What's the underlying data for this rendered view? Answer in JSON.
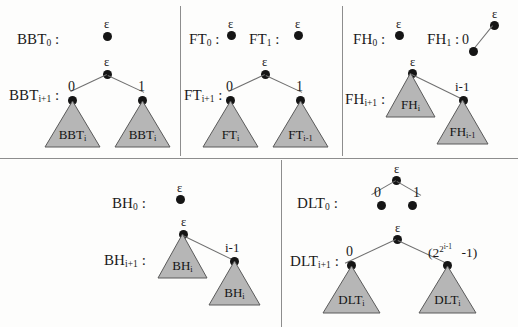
{
  "figure": {
    "epsilon": "ε",
    "colors": {
      "node": "#151515",
      "edge": "#6f6f6f",
      "triangle_fill": "#b6b6b6",
      "triangle_stroke": "#5a5a5a",
      "divider": "#8d8d8d",
      "background": "#fdfdfc"
    }
  },
  "panels": [
    {
      "id": "bbt",
      "name": "BBT",
      "base_label": "BBT",
      "base_sub": "0",
      "base_colon": ":",
      "base_root_label": "ε",
      "rec_label": "BBT",
      "rec_sub": "i+1",
      "rec_colon": ":",
      "rec_root_label": "ε",
      "left_edge_label": "0",
      "right_edge_label": "1",
      "left_subtree": "BBT",
      "left_subtree_sub": "i",
      "right_subtree": "BBT",
      "right_subtree_sub": "i"
    },
    {
      "id": "ft",
      "name": "FT",
      "base_label": "FT",
      "base_sub": "0",
      "base_colon": ":",
      "base_root_label": "ε",
      "base2_label": "FT",
      "base2_sub": "1",
      "base2_colon": ":",
      "base2_root_label": "ε",
      "rec_label": "FT",
      "rec_sub": "i+1",
      "rec_colon": ":",
      "rec_root_label": "ε",
      "left_edge_label": "0",
      "right_edge_label": "1",
      "left_subtree": "FT",
      "left_subtree_sub": "i",
      "right_subtree": "FT",
      "right_subtree_sub": "i-1"
    },
    {
      "id": "fh",
      "name": "FH",
      "base_label": "FH",
      "base_sub": "0",
      "base_colon": ":",
      "base_root_label": "ε",
      "base2_label": "FH",
      "base2_sub": "1",
      "base2_colon": ":",
      "base2_root_label": "ε",
      "base2_edge_label": "0",
      "rec_label": "FH",
      "rec_sub": "i+1",
      "rec_colon": ":",
      "rec_root_label": "ε",
      "right_edge_label": "i-1",
      "left_subtree": "FH",
      "left_subtree_sub": "i",
      "right_subtree": "FH",
      "right_subtree_sub": "i-1"
    },
    {
      "id": "bh",
      "name": "BH",
      "base_label": "BH",
      "base_sub": "0",
      "base_colon": ":",
      "base_root_label": "ε",
      "rec_label": "BH",
      "rec_sub": "i+1",
      "rec_colon": ":",
      "rec_root_label": "ε",
      "right_edge_label": "i-1",
      "left_subtree": "BH",
      "left_subtree_sub": "i",
      "right_subtree": "BH",
      "right_subtree_sub": "i"
    },
    {
      "id": "dlt",
      "name": "DLT",
      "base_label": "DLT",
      "base_sub": "0",
      "base_colon": ":",
      "base_root_label": "ε",
      "base_left_edge_label": "0",
      "base_right_edge_label": "1",
      "rec_label": "DLT",
      "rec_sub": "i+1",
      "rec_colon": ":",
      "rec_root_label": "ε",
      "left_edge_label": "0",
      "right_edge_label_open": "(2",
      "right_edge_label_exp": "2",
      "right_edge_label_exp2": "i-1",
      "right_edge_label_close": "-1)",
      "left_subtree": "DLT",
      "left_subtree_sub": "i",
      "right_subtree": "DLT",
      "right_subtree_sub": "i"
    }
  ]
}
